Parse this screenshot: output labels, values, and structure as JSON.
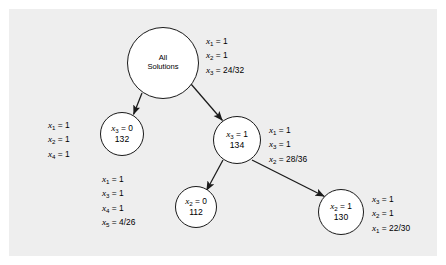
{
  "diagram": {
    "type": "branch-and-bound-search-tree",
    "background_color": "#eeeeee",
    "page_color": "#ffffff",
    "stroke_color": "#1a1a1a",
    "nodes": [
      {
        "id": "root",
        "name": "all-solutions",
        "title_line1": "All",
        "title_line2": "Solutions",
        "equation": "",
        "number": "",
        "cx": 163,
        "cy": 63,
        "r": 36
      },
      {
        "id": "n132",
        "name": "node-132",
        "var": "x",
        "sub": "3",
        "value": "0",
        "equation": "x₃ = 0",
        "number": "132",
        "cx": 122,
        "cy": 134,
        "r": 22
      },
      {
        "id": "n134",
        "name": "node-134",
        "var": "x",
        "sub": "3",
        "value": "1",
        "equation": "x₃ = 1",
        "number": "134",
        "cx": 237,
        "cy": 140,
        "r": 24
      },
      {
        "id": "n112",
        "name": "node-112",
        "var": "x",
        "sub": "2",
        "value": "0",
        "equation": "x₂ = 0",
        "number": "112",
        "cx": 196,
        "cy": 207,
        "r": 21
      },
      {
        "id": "n130",
        "name": "node-130",
        "var": "x",
        "sub": "2",
        "value": "1",
        "equation": "x₂ = 1",
        "number": "130",
        "cx": 341,
        "cy": 212,
        "r": 23
      }
    ],
    "edges": [
      {
        "name": "edge-root-to-132",
        "from": "root",
        "to": "n132",
        "arrow": true
      },
      {
        "name": "edge-root-to-134",
        "from": "root",
        "to": "n134",
        "arrow": true
      },
      {
        "name": "edge-134-to-112",
        "from": "n134",
        "to": "n112",
        "arrow": true
      },
      {
        "name": "edge-134-to-130",
        "from": "n134",
        "to": "n130",
        "arrow": true
      }
    ],
    "labels": [
      {
        "id": "label-root",
        "name": "label-root-solution",
        "align": "left",
        "x": 206,
        "y": 34,
        "rows": [
          {
            "var": "x",
            "sub": "1",
            "value": "1"
          },
          {
            "var": "x",
            "sub": "2",
            "value": "1"
          },
          {
            "var": "x",
            "sub": "3",
            "value": "24/32"
          }
        ]
      },
      {
        "id": "label-132",
        "name": "label-node-132-solution",
        "align": "right",
        "x": 52,
        "y": 118,
        "rows": [
          {
            "var": "x",
            "sub": "1",
            "value": "1"
          },
          {
            "var": "x",
            "sub": "2",
            "value": "1"
          },
          {
            "var": "x",
            "sub": "4",
            "value": "1"
          }
        ]
      },
      {
        "id": "label-134",
        "name": "label-node-134-solution",
        "align": "left",
        "x": 269,
        "y": 123,
        "rows": [
          {
            "var": "x",
            "sub": "1",
            "value": "1"
          },
          {
            "var": "x",
            "sub": "3",
            "value": "1"
          },
          {
            "var": "x",
            "sub": "2",
            "value": "28/36"
          }
        ]
      },
      {
        "id": "label-112",
        "name": "label-node-112-solution",
        "align": "right",
        "x": 106,
        "y": 178,
        "rows": [
          {
            "var": "x",
            "sub": "1",
            "value": "1"
          },
          {
            "var": "x",
            "sub": "3",
            "value": "1"
          },
          {
            "var": "x",
            "sub": "4",
            "value": "1"
          },
          {
            "var": "x",
            "sub": "5",
            "value": "4/26"
          }
        ]
      },
      {
        "id": "label-130",
        "name": "label-node-130-solution",
        "align": "left",
        "x": 372,
        "y": 192,
        "rows": [
          {
            "var": "x",
            "sub": "3",
            "value": "1"
          },
          {
            "var": "x",
            "sub": "2",
            "value": "1"
          },
          {
            "var": "x",
            "sub": "1",
            "value": "22/30"
          }
        ]
      }
    ]
  }
}
